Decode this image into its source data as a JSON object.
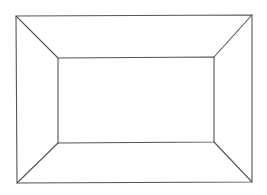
{
  "diagram": {
    "stroke_color": "#555555",
    "background": "#ffffff",
    "outer_rect": {
      "tl": [
        16,
        16
      ],
      "tr": [
        252,
        15
      ],
      "br": [
        252,
        182
      ],
      "bl": [
        17,
        183
      ]
    },
    "inner_rect": {
      "tl": [
        58,
        58
      ],
      "tr": [
        214,
        57
      ],
      "br": [
        214,
        142
      ],
      "bl": [
        58,
        143
      ]
    }
  }
}
